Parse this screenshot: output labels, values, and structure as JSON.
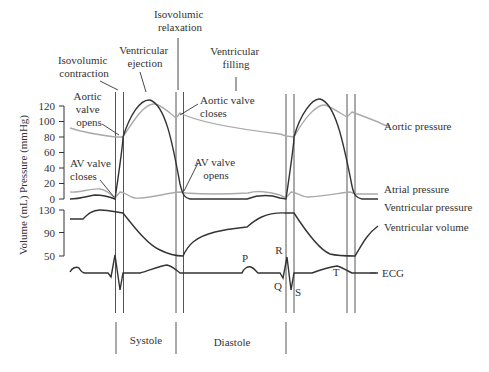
{
  "phase_labels": {
    "isovolumic_contraction": [
      "Isovolumic",
      "contraction"
    ],
    "ventricular_ejection": [
      "Ventricular",
      "ejection"
    ],
    "isovolumic_relaxation": [
      "Isovolumic",
      "relaxation"
    ],
    "ventricular_filling": [
      "Ventricular",
      "filling"
    ]
  },
  "event_labels": {
    "aortic_valve_opens": [
      "Aortic",
      "valve",
      "opens"
    ],
    "aortic_valve_closes": [
      "Aortic valve",
      "closes"
    ],
    "av_valve_closes": [
      "AV valve",
      "closes"
    ],
    "av_valve_opens": [
      "AV valve",
      "opens"
    ]
  },
  "trace_labels": {
    "aortic_pressure": "Aortic pressure",
    "atrial_pressure": "Atrial pressure",
    "ventricular_pressure": "Ventricular pressure",
    "ventricular_volume": "Ventricular volume",
    "ecg": "ECG"
  },
  "ecg_waves": {
    "p": "P",
    "q": "Q",
    "r": "R",
    "s": "S",
    "t": "T"
  },
  "y_axis": {
    "label": "Volume (mL) Pressure (mmHg)",
    "pressure_ticks": [
      "120",
      "100",
      "80",
      "60",
      "40",
      "20",
      "0"
    ],
    "volume_ticks": [
      "130",
      "90",
      "50"
    ]
  },
  "bottom_phases": {
    "systole": "Systole",
    "diastole": "Diastole"
  }
}
